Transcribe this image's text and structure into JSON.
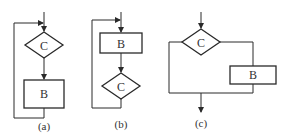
{
  "diagrams": [
    {
      "id": "a",
      "caption": "(a)",
      "decision_label": "C",
      "process_label": "B",
      "structure": "while-loop: condition C tested first, then process B, loop back to before C"
    },
    {
      "id": "b",
      "caption": "(b)",
      "process_label": "B",
      "decision_label": "C",
      "structure": "do-while loop: process B executed first, then condition C, loop back to before B"
    },
    {
      "id": "c",
      "caption": "(c)",
      "decision_label": "C",
      "process_label": "B",
      "structure": "if-then branch: condition C, one branch goes through B, other bypasses; both merge"
    }
  ],
  "colors": {
    "line": "#2a2a2a",
    "text": "#333333",
    "background": "#ffffff"
  }
}
